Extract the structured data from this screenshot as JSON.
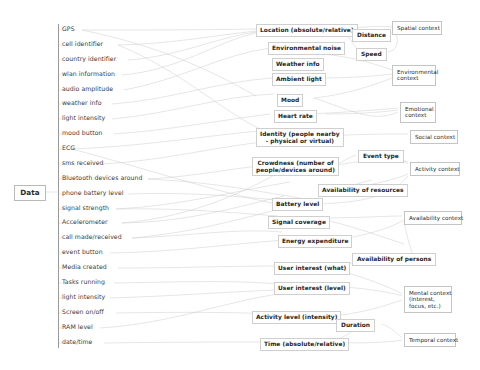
{
  "diagram": {
    "root": {
      "label": "Data"
    },
    "colors": {
      "edge": "#c9c9c9",
      "box_border": "#cfcfcf",
      "text": "#2b2b2b"
    },
    "data_sources": [
      {
        "label": "GPS"
      },
      {
        "label": "cell identifier"
      },
      {
        "label": "country identifier"
      },
      {
        "label": "wlan information"
      },
      {
        "label": "audio amplitude"
      },
      {
        "label": "weather info"
      },
      {
        "label": "light intensity"
      },
      {
        "label": "mood button"
      },
      {
        "label": "ECG"
      },
      {
        "label": "sms received"
      },
      {
        "label": "Bluetooth devices around"
      },
      {
        "label": "phone battery level"
      },
      {
        "label": "signal strength"
      },
      {
        "label": "Accelerometer"
      },
      {
        "label": "call made/received"
      },
      {
        "label": "event button"
      },
      {
        "label": "Media created"
      },
      {
        "label": "Tasks running"
      },
      {
        "label": "light intensity"
      },
      {
        "label": "Screen on/off"
      },
      {
        "label": "RAM level"
      },
      {
        "label": "date/time"
      }
    ],
    "attributes": [
      {
        "label": "Location (absolute/relative)"
      },
      {
        "label": "Environmental noise"
      },
      {
        "label": "Weather info"
      },
      {
        "label": "Ambient light"
      },
      {
        "label": "Mood"
      },
      {
        "label": "Heart rate"
      },
      {
        "label": "Identity (people nearby\n- physical or virtual)"
      },
      {
        "label": "Crowdness (number of\npeople/devices around)"
      },
      {
        "label": "Availability of resources"
      },
      {
        "label": "Battery level"
      },
      {
        "label": "Signal coverage"
      },
      {
        "label": "Energy expenditure"
      },
      {
        "label": "User interest (what)"
      },
      {
        "label": "User interest (level)"
      },
      {
        "label": "Activity level (intensity)"
      },
      {
        "label": "Time (absolute/relative)"
      }
    ],
    "intermediates": [
      {
        "label": "Distance"
      },
      {
        "label": "Speed"
      },
      {
        "label": "Event type"
      },
      {
        "label": "Availability of persons"
      },
      {
        "label": "Duration"
      }
    ],
    "contexts": [
      {
        "label": "Spatial context"
      },
      {
        "label": "Environmental\ncontext"
      },
      {
        "label": "Emotional\ncontext"
      },
      {
        "label": "Social context"
      },
      {
        "label": "Activity context"
      },
      {
        "label": "Availability context"
      },
      {
        "label": "Mental context\n(interest,\nfocus, etc.)"
      },
      {
        "label": "Temporal context"
      }
    ]
  }
}
